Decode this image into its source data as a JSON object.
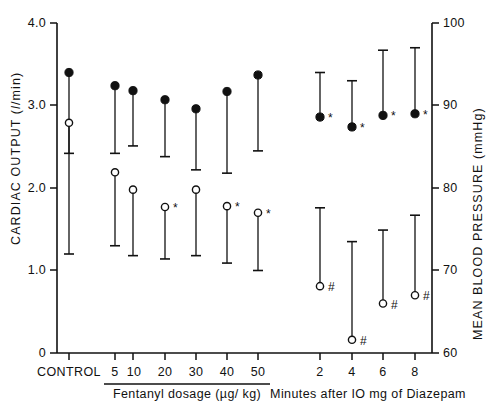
{
  "chart_data": {
    "type": "scatter",
    "title": "",
    "subtitle": "",
    "left_axis": {
      "label_parts": [
        "CARDIAC OUTPUT (",
        "l",
        "/min)"
      ],
      "label": "CARDIAC OUTPUT (l/min)",
      "ticks": [
        0,
        1.0,
        2.0,
        3.0,
        4.0
      ],
      "tick_labels": [
        "0",
        "1.0",
        "2.0",
        "3.0",
        "4.0"
      ],
      "ylim": [
        0,
        4.0
      ],
      "units": "l/min"
    },
    "right_axis": {
      "label": "MEAN BLOOD PRESSURE (mmHg)",
      "ticks": [
        60,
        70,
        80,
        90,
        100
      ],
      "tick_labels": [
        "60",
        "70",
        "80",
        "90",
        "100"
      ],
      "ylim": [
        60,
        100
      ],
      "units": "mmHg"
    },
    "grid": false,
    "legend": null,
    "series": [
      {
        "name": "Mean blood pressure",
        "marker": "filled-circle",
        "axis": "right",
        "units": "mmHg"
      },
      {
        "name": "Cardiac output",
        "marker": "open-circle",
        "axis": "left",
        "units": "l/min"
      }
    ],
    "x_groups": [
      {
        "name": "control",
        "label": "CONTROL",
        "rule": false,
        "categories": [
          {
            "tick": "",
            "x_px": 69,
            "blood_pressure": {
              "value": 94.0,
              "low": 72.0,
              "high": 94.0,
              "marker_y_value": 94.0,
              "significance": ""
            },
            "cardiac_output": {
              "value": 2.79,
              "low": 2.42,
              "high": 2.79,
              "significance": ""
            }
          }
        ]
      },
      {
        "name": "fentanyl",
        "label": "Fentanyl  dosage (µg/ kg)",
        "rule": true,
        "categories": [
          {
            "tick": "5",
            "x_px": 115,
            "blood_pressure": {
              "value": 92.4,
              "low": 84.2,
              "high": 92.4,
              "significance": ""
            },
            "cardiac_output": {
              "value": 2.19,
              "low": 1.3,
              "high": 2.19,
              "significance": ""
            }
          },
          {
            "tick": "10",
            "x_px": 133,
            "blood_pressure": {
              "value": 91.8,
              "low": 85.1,
              "high": 91.8,
              "significance": ""
            },
            "cardiac_output": {
              "value": 1.98,
              "low": 1.18,
              "high": 1.98,
              "significance": ""
            }
          },
          {
            "tick": "20",
            "x_px": 165,
            "blood_pressure": {
              "value": 90.7,
              "low": 83.8,
              "high": 90.7,
              "significance": ""
            },
            "cardiac_output": {
              "value": 1.77,
              "low": 1.14,
              "high": 1.77,
              "significance": "*"
            }
          },
          {
            "tick": "30",
            "x_px": 196,
            "blood_pressure": {
              "value": 89.6,
              "low": 82.2,
              "high": 89.6,
              "significance": ""
            },
            "cardiac_output": {
              "value": 1.98,
              "low": 1.18,
              "high": 1.98,
              "significance": ""
            }
          },
          {
            "tick": "40",
            "x_px": 227,
            "blood_pressure": {
              "value": 91.7,
              "low": 81.8,
              "high": 91.7,
              "significance": ""
            },
            "cardiac_output": {
              "value": 1.78,
              "low": 1.09,
              "high": 1.78,
              "significance": "*"
            }
          },
          {
            "tick": "50",
            "x_px": 258,
            "blood_pressure": {
              "value": 93.7,
              "low": 84.5,
              "high": 93.7,
              "significance": ""
            },
            "cardiac_output": {
              "value": 1.7,
              "low": 1.0,
              "high": 1.7,
              "significance": "*"
            }
          }
        ]
      },
      {
        "name": "diazepam",
        "label": "Minutes after IO mg of Diazepam",
        "rule": false,
        "categories": [
          {
            "tick": "2",
            "x_px": 320,
            "blood_pressure": {
              "value": 88.6,
              "low": 88.6,
              "high": 94.0,
              "significance": "*"
            },
            "cardiac_output": {
              "value": 0.81,
              "low": 0.81,
              "high": 1.76,
              "significance": "#"
            }
          },
          {
            "tick": "4",
            "x_px": 352,
            "blood_pressure": {
              "value": 87.4,
              "low": 87.4,
              "high": 93.0,
              "significance": "*"
            },
            "cardiac_output": {
              "value": 0.16,
              "low": 0.16,
              "high": 1.35,
              "significance": "#"
            }
          },
          {
            "tick": "6",
            "x_px": 383,
            "blood_pressure": {
              "value": 88.8,
              "low": 88.8,
              "high": 96.7,
              "significance": "*"
            },
            "cardiac_output": {
              "value": 0.6,
              "low": 0.6,
              "high": 1.49,
              "significance": "#"
            }
          },
          {
            "tick": "8",
            "x_px": 415,
            "blood_pressure": {
              "value": 89.0,
              "low": 89.0,
              "high": 97.0,
              "significance": "*"
            },
            "cardiac_output": {
              "value": 0.7,
              "low": 0.7,
              "high": 1.67,
              "significance": "#"
            }
          }
        ]
      }
    ],
    "annotations": {
      "asterisk": "*",
      "hash": "#"
    }
  },
  "labels": {
    "y_left_title_a": "CARDIAC OUTPUT (",
    "y_left_title_ital": "l",
    "y_left_title_b": "/min)",
    "y_right_title": "MEAN BLOOD PRESSURE (mmHg)",
    "control": "CONTROL",
    "fentanyl_caption": "Fentanyl  dosage (µg/ kg)",
    "diazepam_caption": "Minutes after IO mg of Diazepam",
    "tick_4_0": "4.0",
    "tick_3_0": "3.0",
    "tick_2_0": "2.0",
    "tick_1_0": "1.0",
    "tick_0": "0",
    "tick_100": "100",
    "tick_90": "90",
    "tick_80": "80",
    "tick_70": "70",
    "tick_60": "60",
    "x_5": "5",
    "x_10": "10",
    "x_20": "20",
    "x_30": "30",
    "x_40": "40",
    "x_50": "50",
    "x_2": "2",
    "x_4": "4",
    "x_6": "6",
    "x_8": "8"
  },
  "colors": {
    "ink": "#111111",
    "background": "#ffffff"
  }
}
